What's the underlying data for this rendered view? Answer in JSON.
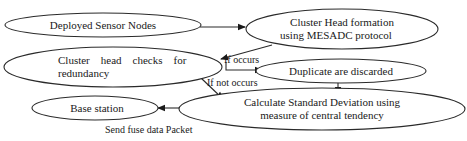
{
  "diagram": {
    "type": "flowchart",
    "nodes": [
      {
        "id": "deployed",
        "lines": [
          "Deployed Sensor Nodes"
        ]
      },
      {
        "id": "cluster_formation",
        "lines": [
          "Cluster Head formation",
          "using MESADC protocol"
        ]
      },
      {
        "id": "redundancy_check",
        "lines": [
          "Cluster    head    checks    for",
          "redundancy"
        ]
      },
      {
        "id": "discard",
        "lines": [
          "Duplicate are discarded"
        ]
      },
      {
        "id": "std_dev",
        "lines": [
          "Calculate Standard Deviation using",
          "measure of central tendency"
        ]
      },
      {
        "id": "base",
        "lines": [
          "Base station"
        ]
      }
    ],
    "edges": [
      {
        "from": "deployed",
        "to": "cluster_formation",
        "label": ""
      },
      {
        "from": "cluster_formation",
        "to": "redundancy_check",
        "label": ""
      },
      {
        "from": "redundancy_check",
        "to": "discard",
        "label": "If occurs"
      },
      {
        "from": "redundancy_check",
        "to": "std_dev",
        "label": "If not occurs"
      },
      {
        "from": "discard",
        "to": "std_dev",
        "label": ""
      },
      {
        "from": "std_dev",
        "to": "base",
        "label": "Send fuse data Packet"
      }
    ]
  }
}
